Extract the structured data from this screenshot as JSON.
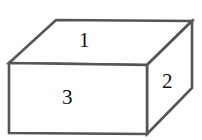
{
  "diagram": {
    "type": "rectangular-prism",
    "faces": [
      {
        "id": "top",
        "label": "1"
      },
      {
        "id": "right",
        "label": "2"
      },
      {
        "id": "front",
        "label": "3"
      }
    ],
    "colors": {
      "stroke": "#555555",
      "fill": "#ffffff",
      "text": "#111111"
    }
  }
}
